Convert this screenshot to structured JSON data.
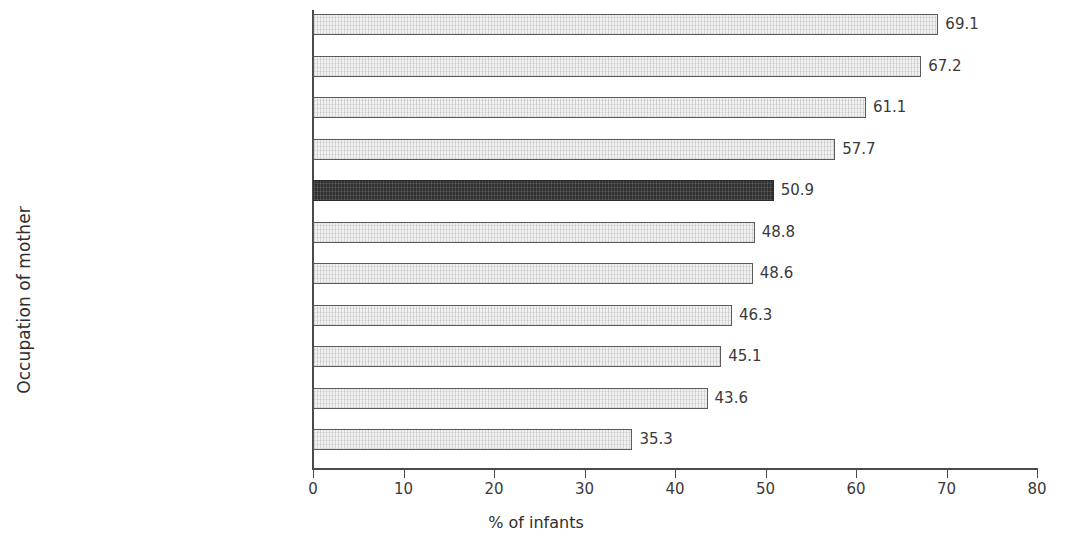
{
  "chart_data": {
    "type": "bar",
    "orientation": "horizontal",
    "title": "",
    "xlabel": "% of infants",
    "ylabel": "Occupation of mother",
    "xlim": [
      0,
      80
    ],
    "xticks": [
      0,
      10,
      20,
      30,
      40,
      50,
      60,
      70,
      80
    ],
    "xtick_labels": [
      "0",
      "10",
      "20",
      "30",
      "40",
      "50",
      "60",
      "70",
      "80"
    ],
    "grid": false,
    "legend": null,
    "categories": [
      "Higher Professional",
      "Lower Professional",
      "Skilled Manual Workers",
      "Employers and Managers",
      "State",
      "Semi-skilled Manual Workers",
      "Salaried Employees",
      "Other Non-manual Workers",
      "Intermediate Non-manual Workers",
      "Home Duties",
      "Unemployed"
    ],
    "values": [
      69.1,
      67.2,
      61.1,
      57.7,
      50.9,
      48.8,
      48.6,
      46.3,
      45.1,
      43.6,
      35.3
    ],
    "value_labels": [
      "69.1",
      "67.2",
      "61.1",
      "57.7",
      "50.9",
      "48.8",
      "48.6",
      "46.3",
      "45.1",
      "43.6",
      "35.3"
    ],
    "highlighted_category": "State",
    "colors": {
      "bar_fill": "#f1f1f1",
      "bar_border": "#5a5a5a",
      "highlight_fill": "#303030",
      "highlight_border": "#2b2b2b",
      "axis": "#4a4a4a",
      "text": "#3a3a3a",
      "background": "#ffffff"
    }
  }
}
